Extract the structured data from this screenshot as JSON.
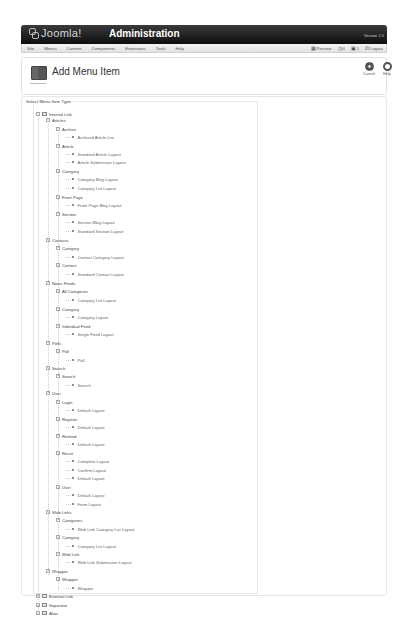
{
  "header": {
    "logo": "Joomla!",
    "title": "Administration",
    "version": "Version 1.5"
  },
  "menubar": {
    "items": [
      "Site",
      "Menus",
      "Content",
      "Components",
      "Extensions",
      "Tools",
      "Help"
    ],
    "status": {
      "preview": "Preview",
      "messages": "0",
      "users": "1",
      "logout": "Logout"
    }
  },
  "toolbar": {
    "title": "Add Menu Item",
    "cancel_label": "Cancel",
    "help_label": "Help"
  },
  "fieldset": {
    "legend": "Select Menu Item Type"
  },
  "tree": [
    {
      "level": 0,
      "label": "Internal Link",
      "type": "root",
      "y": 114
    },
    {
      "level": 1,
      "label": "Articles",
      "type": "group",
      "y": 120
    },
    {
      "level": 2,
      "label": "Archive",
      "type": "group",
      "y": 129
    },
    {
      "level": 3,
      "label": "Archived Article List",
      "type": "leaf",
      "y": 137
    },
    {
      "level": 2,
      "label": "Article",
      "type": "group",
      "y": 146
    },
    {
      "level": 3,
      "label": "Standard Article Layout",
      "type": "leaf",
      "y": 154
    },
    {
      "level": 3,
      "label": "Article Submission Layout",
      "type": "leaf",
      "y": 162
    },
    {
      "level": 2,
      "label": "Category",
      "type": "group",
      "y": 171
    },
    {
      "level": 3,
      "label": "Category Blog Layout",
      "type": "leaf",
      "y": 179
    },
    {
      "level": 3,
      "label": "Category List Layout",
      "type": "leaf",
      "y": 188
    },
    {
      "level": 2,
      "label": "Front Page",
      "type": "group",
      "y": 197
    },
    {
      "level": 3,
      "label": "Front Page Blog Layout",
      "type": "leaf",
      "y": 205
    },
    {
      "level": 2,
      "label": "Section",
      "type": "group",
      "y": 214
    },
    {
      "level": 3,
      "label": "Section Blog Layout",
      "type": "leaf",
      "y": 222
    },
    {
      "level": 3,
      "label": "Standard Section Layout",
      "type": "leaf",
      "y": 231
    },
    {
      "level": 1,
      "label": "Contacts",
      "type": "group",
      "y": 240
    },
    {
      "level": 2,
      "label": "Category",
      "type": "group",
      "y": 248
    },
    {
      "level": 3,
      "label": "Contact Category Layout",
      "type": "leaf",
      "y": 257
    },
    {
      "level": 2,
      "label": "Contact",
      "type": "group",
      "y": 265
    },
    {
      "level": 3,
      "label": "Standard Contact Layout",
      "type": "leaf",
      "y": 274
    },
    {
      "level": 1,
      "label": "News Feeds",
      "type": "group",
      "y": 283
    },
    {
      "level": 2,
      "label": "All Categories",
      "type": "group",
      "y": 291
    },
    {
      "level": 3,
      "label": "Category List Layout",
      "type": "leaf",
      "y": 300
    },
    {
      "level": 2,
      "label": "Category",
      "type": "group",
      "y": 309
    },
    {
      "level": 3,
      "label": "Category Layout",
      "type": "leaf",
      "y": 317
    },
    {
      "level": 2,
      "label": "Individual Feed",
      "type": "group",
      "y": 326
    },
    {
      "level": 3,
      "label": "Single Feed Layout",
      "type": "leaf",
      "y": 334
    },
    {
      "level": 1,
      "label": "Polls",
      "type": "group",
      "y": 343
    },
    {
      "level": 2,
      "label": "Poll",
      "type": "group",
      "y": 351
    },
    {
      "level": 3,
      "label": "Poll",
      "type": "leaf",
      "y": 360
    },
    {
      "level": 1,
      "label": "Search",
      "type": "group",
      "y": 368
    },
    {
      "level": 2,
      "label": "Search",
      "type": "group",
      "y": 376
    },
    {
      "level": 3,
      "label": "Search",
      "type": "leaf",
      "y": 385
    },
    {
      "level": 1,
      "label": "User",
      "type": "group",
      "y": 393
    },
    {
      "level": 2,
      "label": "Login",
      "type": "group",
      "y": 402
    },
    {
      "level": 3,
      "label": "Default Layout",
      "type": "leaf",
      "y": 410
    },
    {
      "level": 2,
      "label": "Register",
      "type": "group",
      "y": 419
    },
    {
      "level": 3,
      "label": "Default Layout",
      "type": "leaf",
      "y": 427
    },
    {
      "level": 2,
      "label": "Remind",
      "type": "group",
      "y": 436
    },
    {
      "level": 3,
      "label": "Default Layout",
      "type": "leaf",
      "y": 444
    },
    {
      "level": 2,
      "label": "Reset",
      "type": "group",
      "y": 453
    },
    {
      "level": 3,
      "label": "Complete Layout",
      "type": "leaf",
      "y": 461
    },
    {
      "level": 3,
      "label": "Confirm Layout",
      "type": "leaf",
      "y": 470
    },
    {
      "level": 3,
      "label": "Default Layout",
      "type": "leaf",
      "y": 478
    },
    {
      "level": 2,
      "label": "User",
      "type": "group",
      "y": 487
    },
    {
      "level": 3,
      "label": "Default Layout",
      "type": "leaf",
      "y": 495
    },
    {
      "level": 3,
      "label": "Form Layout",
      "type": "leaf",
      "y": 504
    },
    {
      "level": 1,
      "label": "Web Links",
      "type": "group",
      "y": 512
    },
    {
      "level": 2,
      "label": "Categories",
      "type": "group",
      "y": 520
    },
    {
      "level": 3,
      "label": "Web Link Category List Layout",
      "type": "leaf",
      "y": 529
    },
    {
      "level": 2,
      "label": "Category",
      "type": "group",
      "y": 537
    },
    {
      "level": 3,
      "label": "Category List Layout",
      "type": "leaf",
      "y": 546
    },
    {
      "level": 2,
      "label": "Web Link",
      "type": "group",
      "y": 554
    },
    {
      "level": 3,
      "label": "Web Link Submission Layout",
      "type": "leaf",
      "y": 562
    },
    {
      "level": 1,
      "label": "Wrapper",
      "type": "group",
      "y": 571
    },
    {
      "level": 2,
      "label": "Wrapper",
      "type": "group",
      "y": 579
    },
    {
      "level": 3,
      "label": "Wrapper",
      "type": "leaf",
      "y": 588
    },
    {
      "level": 0,
      "label": "External Link",
      "type": "root",
      "y": 596
    },
    {
      "level": 0,
      "label": "Separator",
      "type": "root",
      "y": 605
    },
    {
      "level": 0,
      "label": "Alias",
      "type": "root",
      "y": 613
    }
  ],
  "colors": {
    "header_bg": "#1a1a1a",
    "menubar_bg": "#eeeeee",
    "text": "#333333"
  }
}
